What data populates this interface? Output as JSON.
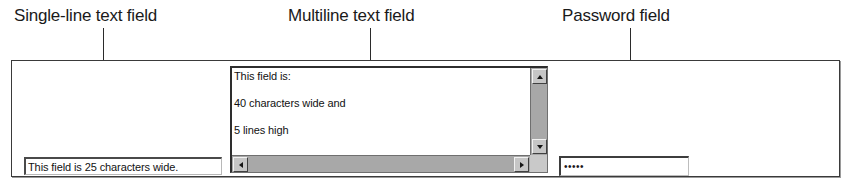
{
  "figure": {
    "callouts": [
      {
        "id": "single-line",
        "label": "Single-line text field"
      },
      {
        "id": "multiline",
        "label": "Multiline text field"
      },
      {
        "id": "password",
        "label": "Password field"
      }
    ]
  },
  "form": {
    "single_line_input": {
      "value": "This field is 25 characters wide.",
      "size_characters": 25
    },
    "multiline_textarea": {
      "lines": [
        "This field is:",
        "40 characters wide and",
        "5 lines high"
      ],
      "cols": 40,
      "rows": 5,
      "scrollbars": {
        "vertical_up": "scroll-up-arrow",
        "vertical_down": "scroll-down-arrow",
        "horizontal_left": "scroll-left-arrow",
        "horizontal_right": "scroll-right-arrow"
      }
    },
    "password_input": {
      "masked_value": "•••••",
      "mask_display": "•••••"
    }
  },
  "colors": {
    "ink": "#1a1a1a",
    "panel_border": "#3a3a3a",
    "scrollbar_track": "#a8a8a8",
    "scrollbar_button": "#c6c6c6",
    "field_background": "#ffffff"
  }
}
